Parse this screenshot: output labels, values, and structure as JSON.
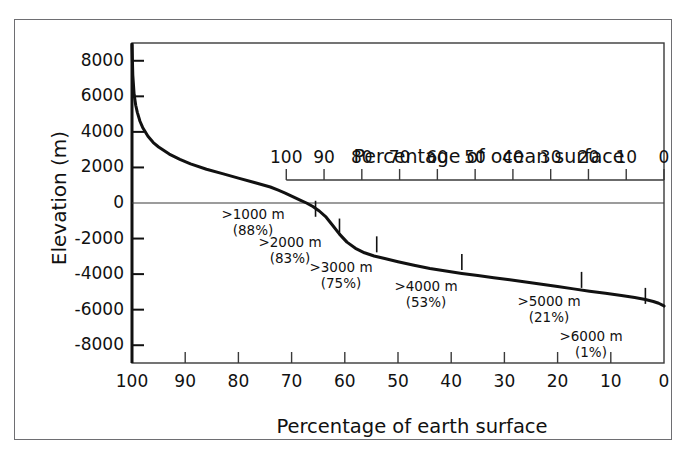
{
  "chart_data": {
    "type": "line",
    "title": "",
    "xlabel": "Percentage of earth surface",
    "ylabel": "Elevation (m)",
    "secondary_xlabel": "Percentage of ocean surface",
    "xlim": [
      100,
      0
    ],
    "ylim": [
      -9000,
      9000
    ],
    "xticks": [
      "100",
      "90",
      "80",
      "70",
      "60",
      "50",
      "40",
      "30",
      "20",
      "10",
      "0"
    ],
    "xtick_values": [
      100,
      90,
      80,
      70,
      60,
      50,
      40,
      30,
      20,
      10,
      0
    ],
    "yticks": [
      "8000",
      "6000",
      "4000",
      "2000",
      "0",
      "-2000",
      "-4000",
      "-6000",
      "-8000"
    ],
    "ytick_values": [
      8000,
      6000,
      4000,
      2000,
      0,
      -2000,
      -4000,
      -6000,
      -8000
    ],
    "secondary_xticks": [
      "100",
      "90",
      "80",
      "70",
      "60",
      "50",
      "40",
      "30",
      "20",
      "10",
      "0"
    ],
    "secondary_xtick_values": [
      100,
      90,
      80,
      70,
      60,
      50,
      40,
      30,
      20,
      10,
      0
    ],
    "secondary_axis_range_on_primary": [
      71,
      0
    ],
    "grid": false,
    "legend": null,
    "series": [
      {
        "name": "Hypsographic curve",
        "x": [
          100.0,
          99.85,
          99.6,
          99.3,
          99.0,
          98.5,
          98.0,
          97.0,
          96.0,
          95.0,
          93.0,
          91.0,
          89.0,
          86.0,
          83.0,
          80.0,
          77.0,
          74.0,
          72.5,
          71.2,
          70.2,
          69.3,
          68.3,
          67.2,
          66.0,
          64.8,
          63.5,
          62.3,
          61.0,
          59.6,
          58.0,
          56.3,
          54.5,
          52.5,
          50.0,
          47.0,
          44.0,
          41.0,
          38.0,
          35.0,
          32.0,
          29.0,
          26.0,
          23.0,
          20.0,
          17.0,
          14.0,
          11.0,
          8.0,
          5.5,
          3.5,
          2.0,
          1.0,
          0.3,
          0.0
        ],
        "y": [
          8900,
          7200,
          6100,
          5500,
          5100,
          4600,
          4250,
          3750,
          3400,
          3150,
          2750,
          2450,
          2200,
          1900,
          1650,
          1400,
          1150,
          900,
          720,
          560,
          420,
          290,
          150,
          0,
          -200,
          -450,
          -800,
          -1250,
          -1750,
          -2200,
          -2550,
          -2800,
          -2980,
          -3120,
          -3300,
          -3500,
          -3680,
          -3830,
          -3960,
          -4080,
          -4200,
          -4320,
          -4440,
          -4570,
          -4700,
          -4830,
          -4960,
          -5080,
          -5200,
          -5320,
          -5430,
          -5540,
          -5640,
          -5740,
          -5800
        ]
      }
    ],
    "annotations": [
      {
        "depth_label": ">1000 m",
        "percent_label": "(88%)",
        "x_earth": 65.5,
        "y": -1000,
        "text_x": 252,
        "text_y": 206
      },
      {
        "depth_label": ">2000 m",
        "percent_label": "(83%)",
        "x_earth": 61.0,
        "y": -2000,
        "text_x": 289,
        "text_y": 234
      },
      {
        "depth_label": ">3000 m",
        "percent_label": "(75%)",
        "x_earth": 54.0,
        "y": -3000,
        "text_x": 340,
        "text_y": 259
      },
      {
        "depth_label": ">4000 m",
        "percent_label": "(53%)",
        "x_earth": 38.0,
        "y": -4000,
        "text_x": 425,
        "text_y": 278
      },
      {
        "depth_label": ">5000 m",
        "percent_label": "(21%)",
        "x_earth": 15.5,
        "y": -5000,
        "text_x": 548,
        "text_y": 293
      },
      {
        "depth_label": ">6000 m",
        "percent_label": "(1%)",
        "x_earth": 3.5,
        "y": -5900,
        "text_x": 590,
        "text_y": 328
      }
    ],
    "curve_color": "#111111",
    "axis_color": "#3a3a3a",
    "frame_color": "#6e6e72",
    "background_color": "#ffffff"
  }
}
